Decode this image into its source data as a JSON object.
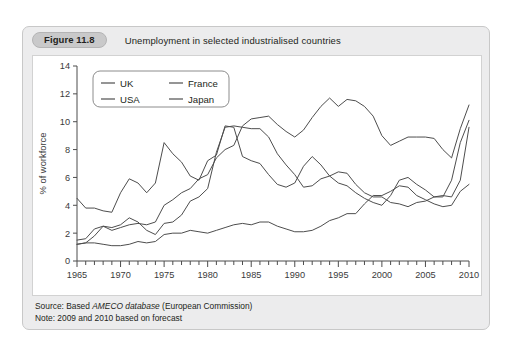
{
  "figure": {
    "badge": "Figure 11.8",
    "title": "Unemployment in selected industrialised countries",
    "source_prefix": "Source: Based ",
    "source_italic": "AMECO database",
    "source_suffix": " (European Commission)",
    "note": "Note: 2009 and 2010 based on forecast"
  },
  "chart_data": {
    "type": "line",
    "title": "Unemployment in selected industrialised countries",
    "xlabel": "",
    "ylabel": "% of workforce",
    "xlim": [
      1965,
      2010
    ],
    "ylim": [
      0,
      14
    ],
    "ytick_step": 2,
    "xtick_step": 5,
    "xtick_minor_step": 1,
    "grid": false,
    "legend_position": "top-left",
    "line_color": "#4d4d4d",
    "x": [
      1965,
      1966,
      1967,
      1968,
      1969,
      1970,
      1971,
      1972,
      1973,
      1974,
      1975,
      1976,
      1977,
      1978,
      1979,
      1980,
      1981,
      1982,
      1983,
      1984,
      1985,
      1986,
      1987,
      1988,
      1989,
      1990,
      1991,
      1992,
      1993,
      1994,
      1995,
      1996,
      1997,
      1998,
      1999,
      2000,
      2001,
      2002,
      2003,
      2004,
      2005,
      2006,
      2007,
      2008,
      2009,
      2010
    ],
    "ytick_labels": [
      "0",
      "2",
      "4",
      "6",
      "8",
      "10",
      "12",
      "14"
    ],
    "xtick_labels": [
      "1965",
      "1970",
      "1975",
      "1980",
      "1985",
      "1990",
      "1995",
      "2000",
      "2005",
      "2010"
    ],
    "series": [
      {
        "name": "UK",
        "values": [
          1.5,
          1.6,
          2.3,
          2.5,
          2.4,
          2.6,
          3.1,
          2.8,
          2.2,
          1.9,
          2.7,
          2.8,
          3.3,
          4.3,
          4.6,
          5.2,
          7.8,
          9.6,
          9.7,
          9.6,
          9.5,
          9.5,
          8.9,
          7.7,
          6.9,
          6.2,
          5.3,
          5.4,
          5.9,
          6.1,
          6.4,
          6.3,
          5.5,
          4.9,
          4.6,
          4.6,
          4.2,
          4.1,
          3.9,
          4.2,
          4.3,
          4.6,
          4.7,
          4.6,
          5.8,
          9.6
        ]
      },
      {
        "name": "USA",
        "values": [
          4.5,
          3.8,
          3.8,
          3.6,
          3.5,
          4.9,
          5.9,
          5.6,
          4.9,
          5.6,
          8.5,
          7.7,
          7.1,
          6.1,
          5.8,
          7.2,
          7.6,
          9.7,
          9.6,
          7.5,
          7.2,
          7.0,
          6.2,
          5.5,
          5.3,
          5.6,
          6.8,
          7.5,
          6.9,
          6.1,
          5.6,
          5.4,
          4.9,
          4.5,
          4.2,
          4.0,
          4.7,
          5.8,
          6.0,
          5.5,
          5.1,
          4.6,
          4.6,
          5.8,
          8.5,
          10.1
        ]
      },
      {
        "name": "France",
        "values": [
          1.2,
          1.3,
          1.8,
          2.5,
          2.2,
          2.4,
          2.6,
          2.7,
          2.6,
          2.8,
          4.0,
          4.4,
          4.9,
          5.2,
          5.9,
          6.2,
          7.4,
          8.0,
          8.3,
          9.7,
          10.2,
          10.3,
          10.4,
          9.8,
          9.3,
          8.9,
          9.4,
          10.3,
          11.1,
          11.7,
          11.1,
          11.6,
          11.5,
          11.1,
          10.4,
          9.0,
          8.3,
          8.6,
          8.9,
          8.9,
          8.9,
          8.8,
          8.0,
          7.4,
          9.5,
          11.2
        ]
      },
      {
        "name": "Japan",
        "values": [
          1.2,
          1.3,
          1.3,
          1.2,
          1.1,
          1.1,
          1.2,
          1.4,
          1.3,
          1.4,
          1.9,
          2.0,
          2.0,
          2.2,
          2.1,
          2.0,
          2.2,
          2.4,
          2.6,
          2.7,
          2.6,
          2.8,
          2.8,
          2.5,
          2.3,
          2.1,
          2.1,
          2.2,
          2.5,
          2.9,
          3.1,
          3.4,
          3.4,
          4.1,
          4.7,
          4.7,
          5.0,
          5.4,
          5.3,
          4.7,
          4.4,
          4.1,
          3.9,
          4.0,
          5.0,
          5.5
        ]
      }
    ],
    "legend": [
      "UK",
      "France",
      "USA",
      "Japan"
    ]
  }
}
